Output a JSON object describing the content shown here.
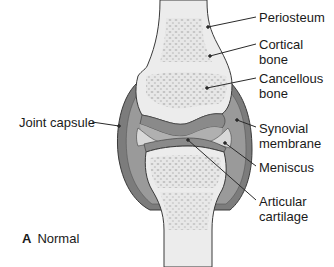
{
  "figure": {
    "caption_letter": "A",
    "caption_text": "Normal"
  },
  "labels": {
    "periosteum": "Periosteum",
    "cortical_1": "Cortical",
    "cortical_2": "bone",
    "cancellous_1": "Cancellous",
    "cancellous_2": "bone",
    "joint_capsule": "Joint capsule",
    "synovial_1": "Synovial",
    "synovial_2": "membrane",
    "meniscus": "Meniscus",
    "articular_1": "Articular",
    "articular_2": "cartilage"
  },
  "colors": {
    "background": "#ffffff",
    "bone_fill": "#ececec",
    "cancellous": "#c4c4c4",
    "capsule_dark": "#7c7c7c",
    "capsule_mid": "#9a9a9a",
    "cartilage": "#8a8a8a",
    "synovial_space": "#b0b0b0",
    "meniscus": "#d8d8d8",
    "outline": "#3a3a3a",
    "leader_line": "#2a2a2a"
  }
}
